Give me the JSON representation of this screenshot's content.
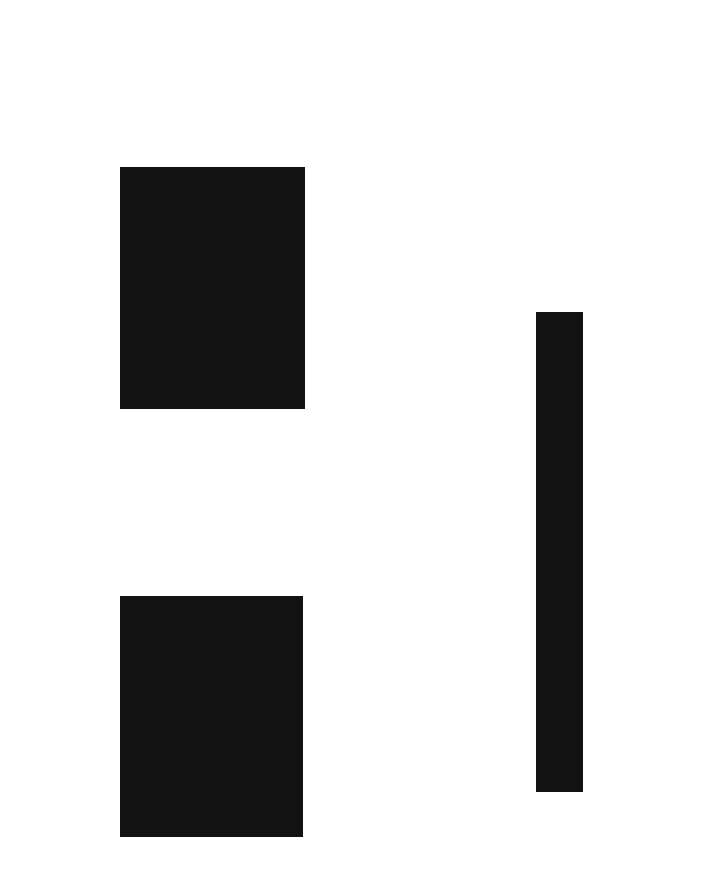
{
  "page": {
    "background": "#ffffff",
    "width": 728,
    "height": 896
  },
  "blocks": [
    {
      "id": "block-top",
      "kind": "black-rectangle",
      "color": "#121212",
      "x": 120,
      "y": 167,
      "width": 185,
      "height": 242
    },
    {
      "id": "block-bottom",
      "kind": "black-rectangle",
      "color": "#121212",
      "x": 120,
      "y": 596,
      "width": 183,
      "height": 241
    },
    {
      "id": "block-right",
      "kind": "black-rectangle",
      "color": "#121212",
      "x": 536,
      "y": 312,
      "width": 47,
      "height": 480
    }
  ]
}
